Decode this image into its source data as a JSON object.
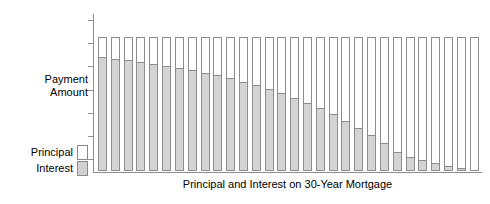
{
  "chart_data": {
    "type": "bar",
    "title": "",
    "xlabel": "Principal and Interest on 30-Year Mortgage",
    "ylabel": "Payment\nAmount",
    "stacked": true,
    "grid": false,
    "legend_position": "left",
    "axis": {
      "y_tick_count": 7,
      "y_tick_labels": [],
      "ylim": [
        0,
        1.18
      ],
      "x_tick_labels": []
    },
    "categories": [
      "1",
      "2",
      "3",
      "4",
      "5",
      "6",
      "7",
      "8",
      "9",
      "10",
      "11",
      "12",
      "13",
      "14",
      "15",
      "16",
      "17",
      "18",
      "19",
      "20",
      "21",
      "22",
      "23",
      "24",
      "25",
      "26",
      "27",
      "28",
      "29",
      "30"
    ],
    "series": [
      {
        "name": "Interest",
        "color": "#d4d4d4",
        "values": [
          0.855,
          0.845,
          0.833,
          0.821,
          0.807,
          0.792,
          0.776,
          0.758,
          0.739,
          0.718,
          0.695,
          0.67,
          0.643,
          0.613,
          0.581,
          0.546,
          0.508,
          0.467,
          0.422,
          0.374,
          0.321,
          0.264,
          0.202,
          0.134,
          0.102,
          0.078,
          0.055,
          0.032,
          0.012,
          0.0
        ]
      },
      {
        "name": "Principal",
        "color": "#ffffff",
        "values": [
          0.145,
          0.155,
          0.167,
          0.179,
          0.193,
          0.208,
          0.224,
          0.242,
          0.261,
          0.282,
          0.305,
          0.33,
          0.357,
          0.387,
          0.419,
          0.454,
          0.492,
          0.533,
          0.578,
          0.626,
          0.679,
          0.736,
          0.798,
          0.866,
          0.898,
          0.922,
          0.945,
          0.968,
          0.988,
          1.0
        ]
      }
    ],
    "total_value": 1.0
  },
  "legend": {
    "items": [
      {
        "label": "Principal",
        "swatch": "principal"
      },
      {
        "label": "Interest",
        "swatch": "interest"
      }
    ]
  },
  "colors": {
    "interest": "#d4d4d4",
    "principal": "#ffffff",
    "axis": "#8d8d8d",
    "text": "#000000",
    "background": "#ffffff"
  }
}
